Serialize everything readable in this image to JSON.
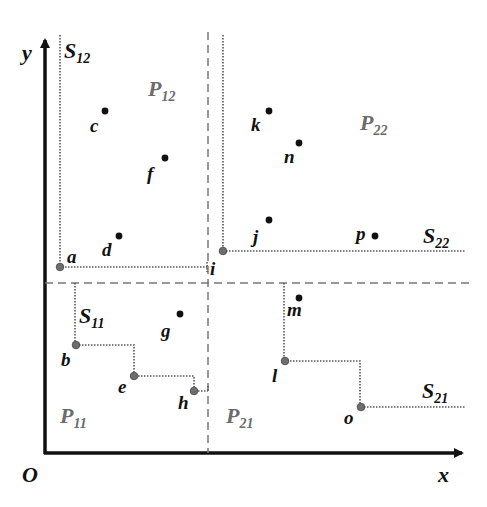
{
  "diagram": {
    "axes": {
      "origin_label": "O",
      "x_label": "x",
      "y_label": "y"
    },
    "regions": [
      {
        "id": "P11",
        "main": "P",
        "sub": "11"
      },
      {
        "id": "P12",
        "main": "P",
        "sub": "12"
      },
      {
        "id": "P21",
        "main": "P",
        "sub": "21"
      },
      {
        "id": "P22",
        "main": "P",
        "sub": "22"
      }
    ],
    "skylines": [
      {
        "id": "S11",
        "main": "S",
        "sub": "11"
      },
      {
        "id": "S12",
        "main": "S",
        "sub": "12"
      },
      {
        "id": "S21",
        "main": "S",
        "sub": "21"
      },
      {
        "id": "S22",
        "main": "S",
        "sub": "22"
      }
    ],
    "points": {
      "a": "a",
      "b": "b",
      "c": "c",
      "d": "d",
      "e": "e",
      "f": "f",
      "g": "g",
      "h": "h",
      "i": "i",
      "j": "j",
      "k": "k",
      "l": "l",
      "m": "m",
      "n": "n",
      "o": "o",
      "p": "p"
    },
    "colors": {
      "axis": "#111111",
      "dashed_partition": "#777777",
      "skyline_dotted": "#555555",
      "skyline_point": "#6e6e6e",
      "regular_point": "#111111",
      "region_label": "#6b6b6b"
    }
  }
}
